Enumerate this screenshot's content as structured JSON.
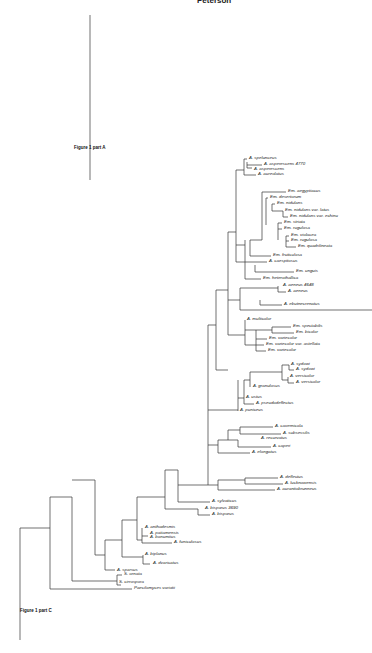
{
  "page_header": "Peterson",
  "figure_labels": {
    "part_a": "Figure 1 part A",
    "part_c": "Figure 1 part C"
  },
  "taxa": [
    {
      "id": "t1",
      "label": "A. spelunceus",
      "x": 249,
      "y": 159
    },
    {
      "id": "t2",
      "label": "A. asperescens  4770",
      "x": 264,
      "y": 165
    },
    {
      "id": "t3",
      "label": "A. asperescens",
      "x": 254,
      "y": 170
    },
    {
      "id": "t4",
      "label": "A. aureolatus",
      "x": 258,
      "y": 175
    },
    {
      "id": "t5",
      "label": "Em. aegyptiacus",
      "x": 288,
      "y": 192
    },
    {
      "id": "t6",
      "label": "Em. desertorum",
      "x": 270,
      "y": 198
    },
    {
      "id": "t7",
      "label": "Em. nidulans",
      "x": 277,
      "y": 204
    },
    {
      "id": "t8",
      "label": "Em. nidulans  var.  latus",
      "x": 285,
      "y": 211
    },
    {
      "id": "t9",
      "label": "Em. nidulans  var.  echinu",
      "x": 290,
      "y": 217
    },
    {
      "id": "t10",
      "label": "Em. striata",
      "x": 284,
      "y": 223
    },
    {
      "id": "t11",
      "label": "Em. rugulosa",
      "x": 284,
      "y": 229
    },
    {
      "id": "t12",
      "label": "Em. violacea",
      "x": 291,
      "y": 236
    },
    {
      "id": "t13",
      "label": "Em. rugulosa",
      "x": 291,
      "y": 241
    },
    {
      "id": "t14",
      "label": "Em. quadrilineata",
      "x": 298,
      "y": 247
    },
    {
      "id": "t15",
      "label": "Em. fruticulosa",
      "x": 273,
      "y": 256
    },
    {
      "id": "t16",
      "label": "A. caespitosus",
      "x": 269,
      "y": 262
    },
    {
      "id": "t17",
      "label": "Em. unguis",
      "x": 296,
      "y": 272
    },
    {
      "id": "t18",
      "label": "Em. heterothallica",
      "x": 263,
      "y": 279
    },
    {
      "id": "t19",
      "label": "A. aeneus  4648",
      "x": 283,
      "y": 286
    },
    {
      "id": "t20",
      "label": "A. aeneus",
      "x": 288,
      "y": 292
    },
    {
      "id": "t21",
      "label": "A. ebutnecrenatus",
      "x": 284,
      "y": 305
    },
    {
      "id": "t22",
      "label": "A. multicolor",
      "x": 247,
      "y": 320
    },
    {
      "id": "t23",
      "label": "Em. spectabilis",
      "x": 293,
      "y": 327
    },
    {
      "id": "t24",
      "label": "Em. bicolor",
      "x": 296,
      "y": 333
    },
    {
      "id": "t25",
      "label": "Em. variecolor",
      "x": 269,
      "y": 339
    },
    {
      "id": "t26",
      "label": "Em. variecolor  var.  astellata",
      "x": 266,
      "y": 345
    },
    {
      "id": "t27",
      "label": "Em. variecolor",
      "x": 268,
      "y": 351
    },
    {
      "id": "t28",
      "label": "A. sydowi",
      "x": 291,
      "y": 365
    },
    {
      "id": "t29",
      "label": "A. sydowi",
      "x": 296,
      "y": 370
    },
    {
      "id": "t30",
      "label": "A. versicolor",
      "x": 290,
      "y": 377
    },
    {
      "id": "t31",
      "label": "A. versicolor",
      "x": 296,
      "y": 383
    },
    {
      "id": "t32",
      "label": "A. granulosus",
      "x": 253,
      "y": 387
    },
    {
      "id": "t33",
      "label": "A. ustus",
      "x": 246,
      "y": 398
    },
    {
      "id": "t34",
      "label": "A. pseudodeflectus",
      "x": 256,
      "y": 404
    },
    {
      "id": "t35",
      "label": "A. puniceus",
      "x": 240,
      "y": 411
    },
    {
      "id": "t36",
      "label": "A. cavernicola",
      "x": 275,
      "y": 427
    },
    {
      "id": "t37",
      "label": "A. subsessilis",
      "x": 283,
      "y": 434
    },
    {
      "id": "t38",
      "label": "A. recurvatus",
      "x": 261,
      "y": 439
    },
    {
      "id": "t39",
      "label": "A. caperi",
      "x": 273,
      "y": 447
    },
    {
      "id": "t40",
      "label": "A. elongatus",
      "x": 252,
      "y": 453
    },
    {
      "id": "t41",
      "label": "A. deflectus",
      "x": 280,
      "y": 478
    },
    {
      "id": "t42",
      "label": "A. lucknowensis",
      "x": 285,
      "y": 484
    },
    {
      "id": "t43",
      "label": "A. aurantiobrunneus",
      "x": 277,
      "y": 490
    },
    {
      "id": "t44",
      "label": "A. sylvaticus",
      "x": 212,
      "y": 502
    },
    {
      "id": "t45",
      "label": "A. bisporus  3690",
      "x": 205,
      "y": 509
    },
    {
      "id": "t46",
      "label": "A. bisporus",
      "x": 212,
      "y": 515
    },
    {
      "id": "t47",
      "label": "A. anthodesmis",
      "x": 145,
      "y": 528
    },
    {
      "id": "t48",
      "label": "A. patiamensis",
      "x": 150,
      "y": 534
    },
    {
      "id": "t49",
      "label": "A. bonumiius",
      "x": 150,
      "y": 538
    },
    {
      "id": "t50",
      "label": "A. funiculosus",
      "x": 174,
      "y": 543
    },
    {
      "id": "t51",
      "label": "A. biplanus",
      "x": 145,
      "y": 555
    },
    {
      "id": "t52",
      "label": "A. dvaricatus",
      "x": 153,
      "y": 564
    },
    {
      "id": "t53",
      "label": "A. sparsus",
      "x": 117,
      "y": 571
    },
    {
      "id": "t54",
      "label": "S. ornata",
      "x": 124,
      "y": 575
    },
    {
      "id": "t55",
      "label": "S. cirrospora",
      "x": 119,
      "y": 583
    },
    {
      "id": "t56",
      "label": "Paecilomyces variotii",
      "x": 134,
      "y": 589
    }
  ],
  "colors": {
    "line": "#333333",
    "text": "#222222",
    "background": "#ffffff"
  }
}
